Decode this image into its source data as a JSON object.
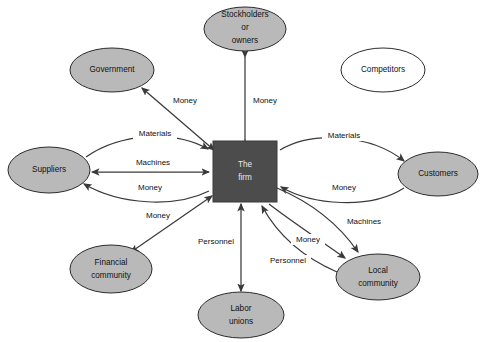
{
  "diagram": {
    "type": "stakeholder-flow-diagram",
    "colors": {
      "node_fill": "#b9b9b9",
      "node_open_fill": "#ffffff",
      "firm_fill": "#4c4c4c",
      "stroke": "#2b2b2b",
      "arrow": "#3a3a3a",
      "background": "#ffffff",
      "label_text": "#111111",
      "firm_text": "#e8e8e8"
    },
    "center": {
      "id": "the-firm",
      "line1": "The",
      "line2": "firm",
      "shape": "rectangle",
      "x": 213,
      "y": 141,
      "w": 64,
      "h": 61
    },
    "nodes": [
      {
        "id": "stockholders-or-owners",
        "lines": [
          "Stockholders",
          "or",
          "owners"
        ],
        "shape": "ellipse",
        "filled": true,
        "cx": 245,
        "cy": 29,
        "rx": 41,
        "ry": 22
      },
      {
        "id": "government",
        "lines": [
          "Government"
        ],
        "shape": "ellipse",
        "filled": true,
        "cx": 112,
        "cy": 70,
        "rx": 42,
        "ry": 22
      },
      {
        "id": "competitors",
        "lines": [
          "Competitors"
        ],
        "shape": "ellipse",
        "filled": false,
        "cx": 383,
        "cy": 70,
        "rx": 42,
        "ry": 22
      },
      {
        "id": "suppliers",
        "lines": [
          "Suppliers"
        ],
        "shape": "ellipse",
        "filled": true,
        "cx": 49,
        "cy": 170,
        "rx": 41,
        "ry": 23
      },
      {
        "id": "customers",
        "lines": [
          "Customers"
        ],
        "shape": "ellipse",
        "filled": true,
        "cx": 438,
        "cy": 174,
        "rx": 40,
        "ry": 22
      },
      {
        "id": "financial-community",
        "lines": [
          "Financial",
          "community"
        ],
        "shape": "ellipse",
        "filled": true,
        "cx": 111,
        "cy": 269,
        "rx": 41,
        "ry": 24
      },
      {
        "id": "labor-unions",
        "lines": [
          "Labor",
          "unions"
        ],
        "shape": "ellipse",
        "filled": true,
        "cx": 241,
        "cy": 315,
        "rx": 43,
        "ry": 23
      },
      {
        "id": "local-community",
        "lines": [
          "Local",
          "community"
        ],
        "shape": "ellipse",
        "filled": true,
        "cx": 378,
        "cy": 277,
        "rx": 42,
        "ry": 23
      }
    ],
    "flows": [
      {
        "id": "flow-government-money",
        "label": "Money",
        "from": "the-firm",
        "to": "government",
        "lx": 185,
        "ly": 101
      },
      {
        "id": "flow-stockholders-money",
        "label": "Money",
        "from": "the-firm",
        "to": "stockholders-or-owners",
        "lx": 265,
        "ly": 101
      },
      {
        "id": "flow-suppliers-materials",
        "label": "Materials",
        "from": "suppliers",
        "to": "the-firm",
        "lx": 155,
        "ly": 134
      },
      {
        "id": "flow-suppliers-machines",
        "label": "Machines",
        "from": "suppliers",
        "to": "the-firm",
        "lx": 153,
        "ly": 163
      },
      {
        "id": "flow-suppliers-money",
        "label": "Money",
        "from": "the-firm",
        "to": "suppliers",
        "lx": 150,
        "ly": 188
      },
      {
        "id": "flow-customers-materials",
        "label": "Materials",
        "from": "the-firm",
        "to": "customers",
        "lx": 344,
        "ly": 136
      },
      {
        "id": "flow-customers-money",
        "label": "Money",
        "from": "customers",
        "to": "the-firm",
        "lx": 344,
        "ly": 188
      },
      {
        "id": "flow-financial-money",
        "label": "Money",
        "from": "the-firm",
        "to": "financial-community",
        "lx": 158,
        "ly": 216
      },
      {
        "id": "flow-labor-personnel",
        "label": "Personnel",
        "from": "labor-unions",
        "to": "the-firm",
        "lx": 216,
        "ly": 242
      },
      {
        "id": "flow-local-machines",
        "label": "Machines",
        "from": "the-firm",
        "to": "local-community",
        "lx": 364,
        "ly": 222
      },
      {
        "id": "flow-local-money",
        "label": "Money",
        "from": "the-firm",
        "to": "local-community",
        "lx": 308,
        "ly": 240
      },
      {
        "id": "flow-local-personnel",
        "label": "Personnel",
        "from": "local-community",
        "to": "the-firm",
        "lx": 288,
        "ly": 261
      }
    ]
  }
}
